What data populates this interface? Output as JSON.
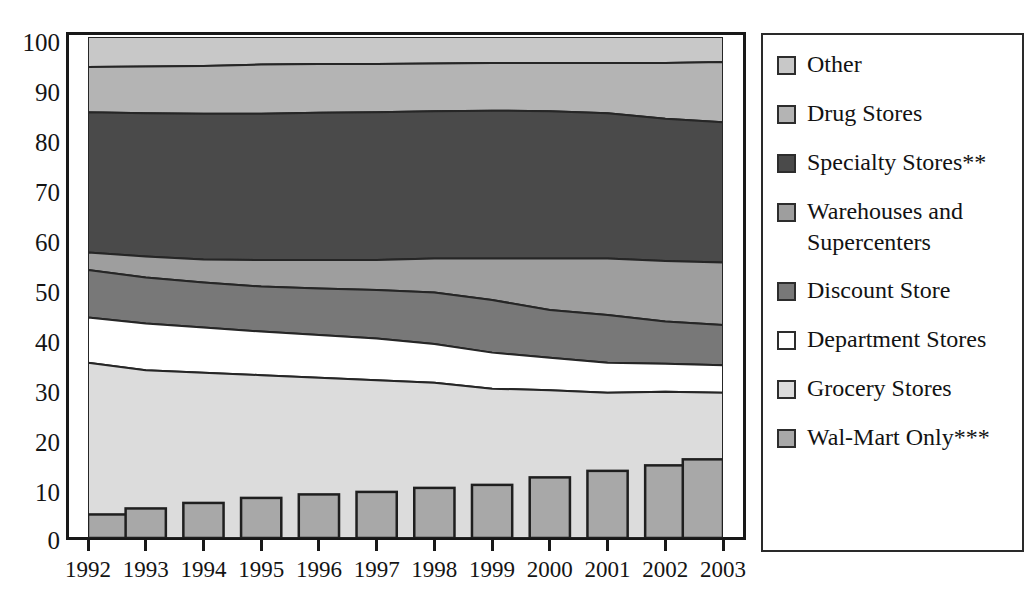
{
  "chart_data": {
    "type": "area",
    "title": "",
    "subtitle": "",
    "xlabel": "",
    "ylabel": "",
    "categories": [
      "1992",
      "1993",
      "1994",
      "1995",
      "1996",
      "1997",
      "1998",
      "1999",
      "2000",
      "2001",
      "2002",
      "2003"
    ],
    "x": [
      1992,
      1993,
      1994,
      1995,
      1996,
      1997,
      1998,
      1999,
      2000,
      2001,
      2002,
      2003
    ],
    "ylim": [
      0,
      100
    ],
    "xlim": [
      1992,
      2003
    ],
    "ytick_labels": [
      "0",
      "10",
      "20",
      "30",
      "40",
      "50",
      "60",
      "70",
      "80",
      "90",
      "100"
    ],
    "ytick_values": [
      0,
      10,
      20,
      30,
      40,
      50,
      60,
      70,
      80,
      90,
      100
    ],
    "grid": false,
    "legend_position": "right",
    "stacked": true,
    "stack_order_bottom_to_top": [
      "Grocery Stores",
      "Department Stores",
      "Discount Store",
      "Warehouses and Supercenters",
      "Specialty Stores**",
      "Drug Stores",
      "Other"
    ],
    "series": [
      {
        "name": "Grocery Stores",
        "color": "#dcdcdc",
        "values": [
          35.0,
          33.5,
          33.0,
          32.5,
          32.0,
          31.5,
          31.0,
          29.8,
          29.5,
          29.0,
          29.2,
          29.0
        ],
        "cumulative_top": [
          35.0,
          33.5,
          33.0,
          32.5,
          32.0,
          31.5,
          31.0,
          29.8,
          29.5,
          29.0,
          29.2,
          29.0
        ]
      },
      {
        "name": "Department Stores",
        "color": "#ffffff",
        "values": [
          9.0,
          9.3,
          9.0,
          8.7,
          8.5,
          8.3,
          7.7,
          7.2,
          6.5,
          6.0,
          5.6,
          5.5
        ],
        "cumulative_top": [
          44.0,
          42.8,
          42.0,
          41.2,
          40.5,
          39.8,
          38.7,
          37.0,
          36.0,
          35.0,
          34.8,
          34.5
        ]
      },
      {
        "name": "Discount Store",
        "color": "#787878",
        "values": [
          9.5,
          9.2,
          9.0,
          9.0,
          9.3,
          9.7,
          10.3,
          10.5,
          9.5,
          9.5,
          8.4,
          8.0
        ],
        "cumulative_top": [
          53.5,
          52.0,
          51.0,
          50.2,
          49.8,
          49.5,
          49.0,
          47.5,
          45.5,
          44.5,
          43.2,
          42.5
        ]
      },
      {
        "name": "Warehouses and Supercenters",
        "color": "#9e9e9e",
        "values": [
          3.5,
          4.2,
          4.6,
          5.3,
          5.7,
          6.0,
          6.8,
          8.3,
          10.3,
          11.3,
          12.1,
          12.5
        ],
        "cumulative_top": [
          57.0,
          56.2,
          55.6,
          55.5,
          55.5,
          55.5,
          55.8,
          55.8,
          55.8,
          55.8,
          55.3,
          55.0
        ]
      },
      {
        "name": "Specialty Stores**",
        "color": "#4a4a4a",
        "values": [
          28.0,
          28.6,
          29.1,
          29.2,
          29.4,
          29.5,
          29.4,
          29.5,
          29.4,
          29.0,
          28.4,
          28.0
        ],
        "cumulative_top": [
          85.0,
          84.8,
          84.7,
          84.7,
          84.9,
          85.0,
          85.2,
          85.3,
          85.2,
          84.8,
          83.7,
          83.0
        ]
      },
      {
        "name": "Drug Stores",
        "color": "#b4b4b4",
        "values": [
          9.0,
          9.3,
          9.5,
          9.8,
          9.7,
          9.6,
          9.5,
          9.5,
          9.6,
          10.0,
          11.1,
          12.0
        ],
        "cumulative_top": [
          94.0,
          94.1,
          94.2,
          94.5,
          94.6,
          94.6,
          94.7,
          94.8,
          94.8,
          94.8,
          94.8,
          95.0
        ]
      },
      {
        "name": "Other",
        "color": "#c8c8c8",
        "values": [
          6.0,
          5.9,
          5.8,
          5.5,
          5.4,
          5.4,
          5.3,
          5.2,
          5.2,
          5.2,
          5.2,
          5.0
        ],
        "cumulative_top": [
          100.0,
          100.0,
          100.0,
          100.0,
          100.0,
          100.0,
          100.0,
          100.0,
          100.0,
          100.0,
          100.0,
          100.0
        ]
      }
    ],
    "overlay_bars": {
      "name": "Wal-Mart Only***",
      "type": "bar",
      "color": "#a8a8a8",
      "values": [
        4.7,
        5.9,
        7.0,
        8.0,
        8.7,
        9.2,
        10.0,
        10.6,
        12.1,
        13.4,
        14.5,
        15.7
      ]
    }
  },
  "axes": {
    "y_tick_labels": [
      "100",
      "90",
      "80",
      "70",
      "60",
      "50",
      "40",
      "30",
      "20",
      "10",
      "0"
    ],
    "x_tick_labels": [
      "1992",
      "1993",
      "1994",
      "1995",
      "1996",
      "1997",
      "1998",
      "1999",
      "2000",
      "2001",
      "2002",
      "2003"
    ]
  },
  "legend": {
    "items": [
      {
        "label": "Other",
        "color": "#c8c8c8",
        "swatch_name": "legend-swatch-other"
      },
      {
        "label": "Drug Stores",
        "color": "#b4b4b4",
        "swatch_name": "legend-swatch-drug-stores"
      },
      {
        "label": "Specialty Stores**",
        "color": "#4a4a4a",
        "swatch_name": "legend-swatch-specialty-stores"
      },
      {
        "label": "Warehouses and\nSupercenters",
        "color": "#9e9e9e",
        "swatch_name": "legend-swatch-warehouses-supercenters"
      },
      {
        "label": "Discount Store",
        "color": "#787878",
        "swatch_name": "legend-swatch-discount-store"
      },
      {
        "label": "Department Stores",
        "color": "#ffffff",
        "swatch_name": "legend-swatch-department-stores"
      },
      {
        "label": "Grocery Stores",
        "color": "#dcdcdc",
        "swatch_name": "legend-swatch-grocery-stores"
      },
      {
        "label": "Wal-Mart Only***",
        "color": "#a8a8a8",
        "swatch_name": "legend-swatch-wal-mart-only"
      }
    ]
  },
  "colors": {
    "axis": "#181818",
    "frame": "#2a2a2a",
    "text": "#141414",
    "background": "#ffffff"
  }
}
